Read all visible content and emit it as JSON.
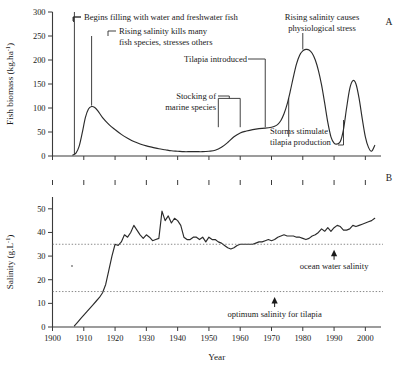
{
  "figure": {
    "panel_a_label": "A",
    "panel_b_label": "B",
    "xlabel": "Year"
  },
  "chart_data": [
    {
      "id": "panel-a",
      "type": "line",
      "title": "",
      "panel": "A",
      "xlabel": "",
      "ylabel": "Fish biomass (kg.ha",
      "ylabel_exponent": "-1",
      "ylabel_suffix": ")",
      "xlim": [
        1900,
        2005
      ],
      "ylim": [
        0,
        300
      ],
      "xticks": [
        1900,
        1910,
        1920,
        1930,
        1940,
        1950,
        1960,
        1970,
        1980,
        1990,
        2000
      ],
      "xticklabels": [
        "1900",
        "1910",
        "1920",
        "1930",
        "1940",
        "1950",
        "1960",
        "1970",
        "1980",
        "1990",
        "2000"
      ],
      "yticks": [
        0,
        50,
        100,
        150,
        200,
        250,
        300
      ],
      "yticklabels": [
        "0",
        "50",
        "100",
        "150",
        "200",
        "250",
        "300"
      ],
      "grid": false,
      "legend": "none",
      "series": [
        {
          "name": "Fish biomass",
          "color": "#2b2b2b",
          "x": [
            1906.5,
            1907.5,
            1908.5,
            1909.5,
            1910.5,
            1911.5,
            1912.5,
            1913.5,
            1914.5,
            1916,
            1918,
            1920,
            1922,
            1924,
            1926,
            1928,
            1930,
            1932,
            1934,
            1936,
            1938,
            1940,
            1942,
            1944,
            1946,
            1948,
            1950,
            1952,
            1954,
            1956,
            1958,
            1960,
            1962,
            1964,
            1966,
            1968,
            1970,
            1971,
            1972,
            1973,
            1974,
            1975,
            1976,
            1977,
            1978,
            1979,
            1980,
            1981,
            1982,
            1983,
            1984,
            1985,
            1986,
            1987,
            1988,
            1989,
            1990,
            1991,
            1992,
            1993,
            1994,
            1995,
            1996,
            1997,
            1998,
            1999,
            2000,
            2001,
            2002,
            2003
          ],
          "y": [
            2,
            6,
            20,
            48,
            80,
            98,
            103,
            101,
            94,
            80,
            66,
            55,
            45,
            37,
            30,
            25,
            21,
            18,
            15,
            13,
            11,
            10,
            9,
            9,
            9,
            9,
            10,
            12,
            18,
            28,
            40,
            48,
            52,
            55,
            57,
            58,
            60,
            62,
            66,
            74,
            88,
            108,
            135,
            165,
            192,
            210,
            219,
            222,
            221,
            214,
            200,
            178,
            148,
            110,
            70,
            40,
            27,
            25,
            30,
            55,
            100,
            140,
            157,
            150,
            120,
            78,
            40,
            18,
            10,
            22
          ]
        }
      ],
      "annotations": [
        {
          "id": "begins-filling",
          "text": [
            "Begins filling with water and freshwater fish"
          ],
          "pointer_year": 1907,
          "pointer_value_top": 300,
          "pointer_value_bottom": 3
        },
        {
          "id": "rising-salinity-kills",
          "text": [
            "Rising salinity kills many",
            "fish species, stresses others"
          ],
          "pointer_year": 1912.5,
          "pointer_value_top": 250,
          "pointer_value_bottom": 105
        },
        {
          "id": "tilapia-introduced",
          "text": [
            "Tilapia introduced"
          ],
          "pointer_year": 1968,
          "pointer_value_top": 200,
          "pointer_value_bottom": 60
        },
        {
          "id": "stocking-marine-species",
          "text": [
            "Stocking of",
            "marine species"
          ],
          "pointer_years": [
            1953,
            1960
          ],
          "pointer_value_top": 120,
          "pointer_value_bottom": 60
        },
        {
          "id": "rising-salinity-stress",
          "text": [
            "Rising salinity causes",
            "physiological stress"
          ],
          "pointer_year": 1980,
          "pointer_value_top": 270,
          "pointer_value_bottom": 222
        },
        {
          "id": "storms-stimulate",
          "text": [
            "Storms stimulate",
            "tilapia production"
          ],
          "pointer_year": 1975.5,
          "pointer_value_top": 120,
          "pointer_value_bottom": 40,
          "pointer_year_2": 1993,
          "pointer2_value_top": 75,
          "pointer2_value_bottom": 8
        }
      ]
    },
    {
      "id": "panel-b",
      "type": "line",
      "title": "",
      "panel": "B",
      "xlabel": "Year",
      "ylabel": "Salinity (g.L",
      "ylabel_exponent": "-1",
      "ylabel_suffix": ")",
      "xlim": [
        1900,
        2005
      ],
      "ylim": [
        0,
        55
      ],
      "xticks": [
        1900,
        1910,
        1920,
        1930,
        1940,
        1950,
        1960,
        1970,
        1980,
        1990,
        2000
      ],
      "xticklabels": [
        "1900",
        "1910",
        "1920",
        "1930",
        "1940",
        "1950",
        "1960",
        "1970",
        "1980",
        "1990",
        "2000"
      ],
      "yticks": [
        0,
        10,
        20,
        30,
        40,
        50
      ],
      "yticklabels": [
        "0",
        "10",
        "20",
        "30",
        "40",
        "50"
      ],
      "grid": false,
      "legend": "none",
      "series": [
        {
          "name": "Salinity",
          "color": "#2b2b2b",
          "x": [
            1907,
            1908,
            1909,
            1910,
            1911,
            1912,
            1913,
            1914,
            1915,
            1916,
            1917,
            1918,
            1919,
            1920,
            1921,
            1922,
            1923,
            1924,
            1925,
            1926,
            1927,
            1928,
            1929,
            1930,
            1931,
            1932,
            1933,
            1934,
            1935,
            1936,
            1937,
            1938,
            1939,
            1940,
            1941,
            1942,
            1943,
            1944,
            1945,
            1946,
            1947,
            1948,
            1949,
            1950,
            1951,
            1952,
            1953,
            1954,
            1955,
            1956,
            1957,
            1958,
            1959,
            1960,
            1961,
            1962,
            1963,
            1964,
            1965,
            1966,
            1967,
            1968,
            1969,
            1970,
            1971,
            1972,
            1973,
            1974,
            1975,
            1976,
            1977,
            1978,
            1979,
            1980,
            1981,
            1982,
            1983,
            1984,
            1985,
            1986,
            1987,
            1988,
            1989,
            1990,
            1991,
            1992,
            1993,
            1994,
            1995,
            1996,
            1997,
            1998,
            1999,
            2000,
            2001,
            2002,
            2003
          ],
          "y": [
            0.5,
            2,
            3.5,
            5,
            6.5,
            8,
            9.5,
            11,
            12.5,
            14.5,
            18,
            24,
            30,
            35,
            34.5,
            36,
            39,
            38,
            40,
            43,
            41,
            39,
            37.5,
            39,
            38,
            36.5,
            37,
            37.5,
            49,
            45,
            47,
            44,
            46,
            45,
            43,
            38,
            37,
            37,
            38,
            38,
            37,
            38,
            36,
            38,
            37,
            37,
            36,
            35.5,
            34.5,
            33.5,
            33,
            33.5,
            34.5,
            35,
            35,
            35,
            35,
            35,
            35.5,
            36,
            36,
            36.5,
            37,
            36.5,
            37,
            38,
            38.5,
            39,
            38.5,
            38.5,
            38.5,
            38,
            38,
            37.5,
            37,
            37.5,
            38.5,
            39,
            40,
            41.5,
            40.5,
            42,
            40.5,
            42,
            43,
            42.5,
            41,
            41,
            41.5,
            43,
            42.5,
            43,
            43.5,
            44,
            44.5,
            45,
            46
          ]
        }
      ],
      "reference_lines": [
        {
          "id": "ocean-water-salinity",
          "label": "ocean water salinity",
          "value": 35,
          "marker_year": 1990
        },
        {
          "id": "optimum-salinity-tilapia",
          "label": "optimum salinity for tilapia",
          "value": 15,
          "marker_year": 1971
        }
      ]
    }
  ]
}
